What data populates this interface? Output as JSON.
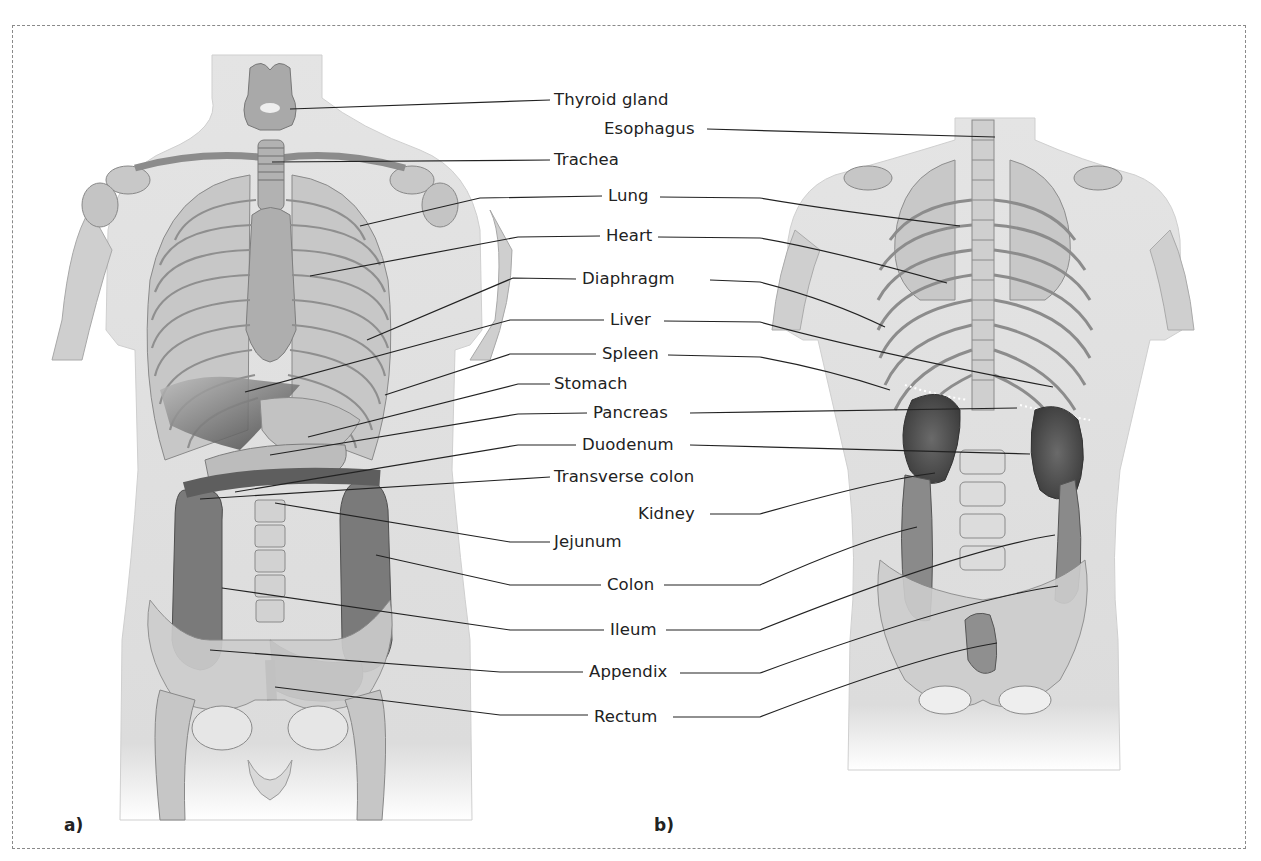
{
  "figure": {
    "panels": [
      {
        "id": "a",
        "label": "a)",
        "view": "anterior"
      },
      {
        "id": "b",
        "label": "b)",
        "view": "posterior"
      }
    ],
    "labels": [
      {
        "text": "Thyroid gland",
        "x": 556,
        "y": 90,
        "side": "left"
      },
      {
        "text": "Esophagus",
        "x": 604,
        "y": 119,
        "side": "right"
      },
      {
        "text": "Trachea",
        "x": 556,
        "y": 150,
        "side": "left"
      },
      {
        "text": "Lung",
        "x": 610,
        "y": 186,
        "side": "both"
      },
      {
        "text": "Heart",
        "x": 607,
        "y": 226,
        "side": "both"
      },
      {
        "text": "Diaphragm",
        "x": 583,
        "y": 270,
        "side": "both"
      },
      {
        "text": "Liver",
        "x": 611,
        "y": 308,
        "side": "both"
      },
      {
        "text": "Spleen",
        "x": 603,
        "y": 343,
        "side": "both"
      },
      {
        "text": "Stomach",
        "x": 556,
        "y": 375,
        "side": "left"
      },
      {
        "text": "Pancreas",
        "x": 594,
        "y": 403,
        "side": "both"
      },
      {
        "text": "Duodenum",
        "x": 583,
        "y": 435,
        "side": "both"
      },
      {
        "text": "Transverse colon",
        "x": 556,
        "y": 467,
        "side": "left"
      },
      {
        "text": "Kidney",
        "x": 639,
        "y": 503,
        "side": "right"
      },
      {
        "text": "Jejunum",
        "x": 556,
        "y": 533,
        "side": "left"
      },
      {
        "text": "Colon",
        "x": 608,
        "y": 573,
        "side": "both"
      },
      {
        "text": "Ileum",
        "x": 611,
        "y": 619,
        "side": "both"
      },
      {
        "text": "Appendix",
        "x": 590,
        "y": 662,
        "side": "both"
      },
      {
        "text": "Rectum",
        "x": 595,
        "y": 706,
        "side": "both"
      }
    ]
  }
}
